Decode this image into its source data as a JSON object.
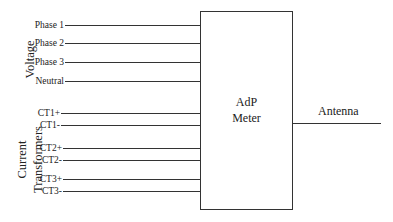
{
  "diagram": {
    "meter": {
      "line1": "AdP",
      "line2": "Meter"
    },
    "output": {
      "label": "Antenna"
    },
    "groups": {
      "voltage": {
        "label": "Voltage"
      },
      "current": {
        "line1": "Current",
        "line2": "Transformers"
      }
    },
    "inputs": [
      {
        "label": "Phase 1",
        "y": 25
      },
      {
        "label": "Phase 2",
        "y": 43
      },
      {
        "label": "Phase 3",
        "y": 62
      },
      {
        "label": "Neutral",
        "y": 81
      },
      {
        "label": "CT1+",
        "y": 113
      },
      {
        "label": "CT1-",
        "y": 125
      },
      {
        "label": "CT2+",
        "y": 148
      },
      {
        "label": "CT2-",
        "y": 160
      },
      {
        "label": "CT3+",
        "y": 179
      },
      {
        "label": "CT3-",
        "y": 191
      }
    ]
  }
}
